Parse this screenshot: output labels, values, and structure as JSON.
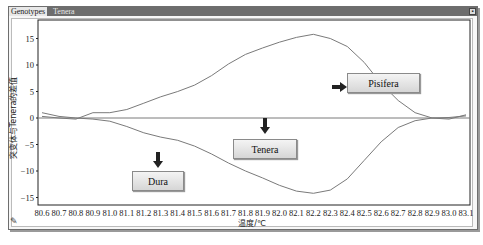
{
  "window": {
    "tabs": [
      {
        "label": "Genotypes",
        "active": true
      },
      {
        "label": "Tenera",
        "active": false
      }
    ],
    "control_glyph": "▪"
  },
  "callouts": {
    "pisifera": "Pisifera",
    "tenera": "Tenera",
    "dura": "Dura"
  },
  "icons": {
    "tool": "✎"
  },
  "chart_data": {
    "type": "line",
    "title": "",
    "xlabel": "温度/℃",
    "ylabel": "突变体与Tenera的差值",
    "x": [
      80.6,
      80.7,
      80.8,
      80.9,
      81.0,
      81.1,
      81.2,
      81.3,
      81.4,
      81.5,
      81.6,
      81.7,
      81.8,
      81.9,
      82.0,
      82.1,
      82.2,
      82.3,
      82.4,
      82.5,
      82.6,
      82.7,
      82.8,
      82.9,
      83.0,
      83.1
    ],
    "x_tick_labels": [
      "80.6",
      "80.7",
      "80.8",
      "80.9",
      "81.0",
      "81.1",
      "81.2",
      "81.3",
      "81.4",
      "81.5",
      "81.6",
      "81.7",
      "81.8",
      "81.9",
      "82.0",
      "82.1",
      "82.2",
      "82.3",
      "82.4",
      "82.5",
      "82.6",
      "82.7",
      "82.8",
      "82.9",
      "83.0",
      "83.1"
    ],
    "y_ticks": [
      15,
      10,
      5,
      0,
      -5,
      -10,
      -15
    ],
    "y_tick_labels": [
      "15",
      "10",
      "5",
      "0",
      "−5",
      "−10",
      "−15"
    ],
    "ylim": [
      -17,
      18.5
    ],
    "xlim": [
      80.6,
      83.1
    ],
    "grid": false,
    "legend": "callout boxes with arrows",
    "series": [
      {
        "name": "Pisifera",
        "color": "#7a7a7a",
        "values": [
          0.3,
          0,
          -0.2,
          1,
          1,
          1.6,
          2.8,
          4,
          5,
          6.2,
          8,
          10.2,
          12,
          13.2,
          14.3,
          15.2,
          15.8,
          15,
          13.5,
          10.5,
          6.5,
          3.3,
          1,
          0,
          -0.2,
          0.6
        ]
      },
      {
        "name": "Tenera",
        "color": "#7a7a7a",
        "values": [
          0,
          0,
          0,
          0,
          0,
          0,
          0,
          0,
          0,
          0,
          0,
          0,
          0,
          0,
          0,
          0,
          0,
          0,
          0,
          0,
          0,
          0,
          0,
          0,
          0,
          0
        ]
      },
      {
        "name": "Dura",
        "color": "#7a7a7a",
        "values": [
          1,
          0.3,
          0,
          -0.2,
          -0.6,
          -1.6,
          -2.8,
          -3.6,
          -4.2,
          -5.3,
          -6.8,
          -8.5,
          -10,
          -11.3,
          -12.7,
          -13.8,
          -14.2,
          -13.6,
          -11.5,
          -8,
          -4.5,
          -1.8,
          -0.5,
          0,
          0.1,
          0.4
        ]
      }
    ]
  }
}
